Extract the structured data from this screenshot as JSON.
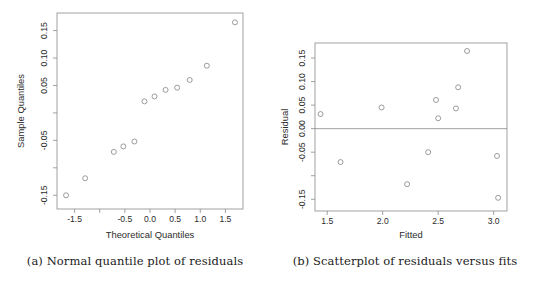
{
  "figure": {
    "panels": [
      {
        "id": "a",
        "caption": "(a) Normal quantile plot of residuals",
        "caption_prefix": "(a)"
      },
      {
        "id": "b",
        "caption": "(b) Scatterplot of residuals versus fits",
        "caption_prefix": "(b)"
      }
    ]
  },
  "chart_data": [
    {
      "type": "scatter",
      "panel": "a",
      "title": "",
      "xlabel": "Theoretical Quantiles",
      "ylabel": "Sample Quantiles",
      "xlim": [
        -1.85,
        1.85
      ],
      "ylim": [
        -0.175,
        0.182
      ],
      "xticks": [
        -1.5,
        -1.0,
        -0.5,
        0.0,
        0.5,
        1.0,
        1.5
      ],
      "xticklabels": [
        "-1.5",
        "",
        "-0.5",
        "0.0",
        "0.5",
        "1.0",
        "1.5"
      ],
      "yticks": [
        0.15,
        0.1,
        0.05,
        0.0,
        -0.05,
        -0.1,
        -0.15
      ],
      "yticklabels": [
        "0.15",
        "0.10",
        "0.05",
        "",
        "-0.05",
        "",
        "-0.15"
      ],
      "grid": false,
      "legend": null,
      "marker": "open-circle",
      "x": [
        -1.67,
        -1.29,
        -0.72,
        -0.53,
        -0.31,
        -0.11,
        0.09,
        0.31,
        0.54,
        0.79,
        1.13,
        1.69
      ],
      "y": [
        -0.15,
        -0.119,
        -0.071,
        -0.061,
        -0.052,
        0.021,
        0.03,
        0.042,
        0.046,
        0.06,
        0.086,
        0.165
      ],
      "points": [
        {
          "x": -1.67,
          "y": -0.15
        },
        {
          "x": -1.29,
          "y": -0.119
        },
        {
          "x": -0.72,
          "y": -0.071
        },
        {
          "x": -0.53,
          "y": -0.061
        },
        {
          "x": -0.31,
          "y": -0.052
        },
        {
          "x": -0.11,
          "y": 0.021
        },
        {
          "x": 0.09,
          "y": 0.03
        },
        {
          "x": 0.31,
          "y": 0.042
        },
        {
          "x": 0.54,
          "y": 0.046
        },
        {
          "x": 0.79,
          "y": 0.06
        },
        {
          "x": 1.13,
          "y": 0.086
        },
        {
          "x": 1.69,
          "y": 0.165
        }
      ]
    },
    {
      "type": "scatter",
      "panel": "b",
      "title": "",
      "xlabel": "Fitted",
      "ylabel": "Residual",
      "xlim": [
        1.39,
        3.12
      ],
      "ylim": [
        -0.175,
        0.182
      ],
      "xticks": [
        1.5,
        2.0,
        2.5,
        3.0
      ],
      "xticklabels": [
        "1.5",
        "2.0",
        "2.5",
        "3.0"
      ],
      "yticks": [
        0.15,
        0.1,
        0.05,
        0.0,
        -0.05,
        -0.1,
        -0.15
      ],
      "yticklabels": [
        "0.15",
        "0.10",
        "0.05",
        "0.00",
        "-0.05",
        "",
        "-0.15"
      ],
      "grid": false,
      "legend": null,
      "marker": "open-circle",
      "reference_line": {
        "orientation": "horizontal",
        "y": 0.0
      },
      "x": [
        1.44,
        1.62,
        1.99,
        2.22,
        2.41,
        2.48,
        2.5,
        2.66,
        2.68,
        2.76,
        3.03,
        3.04
      ],
      "y": [
        0.031,
        -0.071,
        0.045,
        -0.118,
        -0.05,
        0.061,
        0.022,
        0.043,
        0.088,
        0.165,
        -0.058,
        -0.147
      ],
      "points": [
        {
          "x": 1.44,
          "y": 0.031
        },
        {
          "x": 1.62,
          "y": -0.071
        },
        {
          "x": 1.99,
          "y": 0.045
        },
        {
          "x": 2.22,
          "y": -0.118
        },
        {
          "x": 2.41,
          "y": -0.05
        },
        {
          "x": 2.48,
          "y": 0.061
        },
        {
          "x": 2.5,
          "y": 0.022
        },
        {
          "x": 2.66,
          "y": 0.043
        },
        {
          "x": 2.68,
          "y": 0.088
        },
        {
          "x": 2.76,
          "y": 0.165
        },
        {
          "x": 3.03,
          "y": -0.058
        },
        {
          "x": 3.04,
          "y": -0.147
        }
      ]
    }
  ],
  "colors": {
    "marker_stroke": "#8a8a8a",
    "axis": "#8a8a8a",
    "text": "#2b2b2b",
    "caption_text": "#1b1b1b",
    "background": "#ffffff"
  }
}
